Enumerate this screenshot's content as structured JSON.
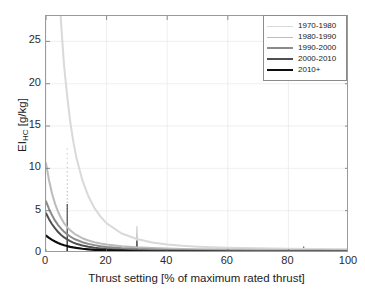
{
  "chart_data": {
    "type": "line",
    "title": "",
    "xlabel": "Thrust setting [% of maximum rated thrust]",
    "ylabel_text": "EI",
    "ylabel_sub": "HC",
    "ylabel_unit": " [g/kg]",
    "ylabel_full": "EI_HC [g/kg]",
    "xlim": [
      0,
      100
    ],
    "ylim": [
      0,
      28
    ],
    "xticks": [
      "0",
      "20",
      "40",
      "60",
      "80",
      "100"
    ],
    "xtick_values": [
      0,
      20,
      40,
      60,
      80,
      100
    ],
    "yticks": [
      "0",
      "5",
      "10",
      "15",
      "20",
      "25"
    ],
    "ytick_values": [
      0,
      5,
      10,
      15,
      20,
      25
    ],
    "grid": true,
    "legend_position": "top-right",
    "x": [
      0,
      1,
      2,
      3,
      4,
      5,
      6,
      7,
      8,
      9,
      10,
      12,
      14,
      16,
      18,
      20,
      25,
      30,
      35,
      40,
      45,
      50,
      60,
      70,
      80,
      90,
      100
    ],
    "series": [
      {
        "name": "1970-1980",
        "color": "#d9d9d9",
        "width": 2.0,
        "values": [
          120.0,
          86.0,
          62.0,
          45.0,
          34.0,
          27.0,
          22.0,
          18.5,
          15.5,
          13.2,
          11.3,
          8.6,
          6.7,
          5.3,
          4.3,
          3.5,
          2.3,
          1.65,
          1.25,
          1.0,
          0.85,
          0.75,
          0.62,
          0.55,
          0.5,
          0.47,
          0.45
        ]
      },
      {
        "name": "1980-1990",
        "color": "#bcbcbc",
        "width": 2.0,
        "values": [
          10.6,
          8.6,
          7.0,
          5.8,
          4.85,
          4.1,
          3.5,
          3.05,
          2.68,
          2.38,
          2.13,
          1.75,
          1.48,
          1.28,
          1.13,
          1.0,
          0.8,
          0.67,
          0.58,
          0.52,
          0.48,
          0.45,
          0.4,
          0.37,
          0.35,
          0.34,
          0.33
        ]
      },
      {
        "name": "1990-2000",
        "color": "#8a8a8a",
        "width": 2.0,
        "values": [
          6.1,
          5.2,
          4.45,
          3.82,
          3.3,
          2.87,
          2.5,
          2.2,
          1.95,
          1.74,
          1.56,
          1.28,
          1.08,
          0.93,
          0.81,
          0.72,
          0.56,
          0.46,
          0.4,
          0.35,
          0.32,
          0.3,
          0.27,
          0.25,
          0.24,
          0.23,
          0.22
        ]
      },
      {
        "name": "2000-2010",
        "color": "#4f4f4f",
        "width": 2.0,
        "values": [
          4.7,
          4.0,
          3.4,
          2.9,
          2.48,
          2.13,
          1.84,
          1.6,
          1.4,
          1.23,
          1.09,
          0.88,
          0.73,
          0.62,
          0.54,
          0.47,
          0.36,
          0.29,
          0.25,
          0.22,
          0.2,
          0.19,
          0.17,
          0.16,
          0.155,
          0.15,
          0.15
        ]
      },
      {
        "name": "2010+",
        "color": "#0d0d0d",
        "width": 2.2,
        "values": [
          2.05,
          1.78,
          1.55,
          1.35,
          1.18,
          1.04,
          0.92,
          0.82,
          0.73,
          0.66,
          0.6,
          0.5,
          0.43,
          0.37,
          0.33,
          0.3,
          0.24,
          0.2,
          0.18,
          0.17,
          0.16,
          0.155,
          0.15,
          0.145,
          0.14,
          0.14,
          0.14
        ]
      }
    ],
    "scatter_clusters": [
      {
        "x": 7,
        "y_min": 0.0,
        "y_max": 12.3,
        "note": "dense vertical cluster of measurements at 7% thrust"
      },
      {
        "x": 30,
        "y_min": 0.0,
        "y_max": 3.1,
        "note": "vertical cluster of measurements at 30% thrust"
      },
      {
        "x": 85,
        "y_min": 0.0,
        "y_max": 0.75,
        "note": "small vertical cluster of measurements at 85% thrust"
      }
    ]
  },
  "legend": {
    "entries": [
      {
        "label": "1970-1980",
        "color": "#d9d9d9"
      },
      {
        "label": "1980-1990",
        "color": "#bcbcbc"
      },
      {
        "label": "1990-2000",
        "color": "#8a8a8a"
      },
      {
        "label": "2000-2010",
        "color": "#4f4f4f"
      },
      {
        "label": "2010+",
        "color": "#0d0d0d"
      }
    ]
  },
  "axes": {
    "x_label": "Thrust setting [% of maximum rated thrust]",
    "y_label_main": "EI",
    "y_label_sub": "HC",
    "y_label_unit": " [g/kg]"
  }
}
